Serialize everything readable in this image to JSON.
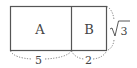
{
  "diagram": {
    "regions": [
      {
        "id": "A",
        "label": "A"
      },
      {
        "id": "B",
        "label": "B"
      }
    ],
    "dimensions": {
      "width_A": "5",
      "width_B": "2",
      "height": "3"
    },
    "colors": {
      "stroke": "#555555",
      "dotted": "#777777",
      "text": "#444444"
    }
  }
}
